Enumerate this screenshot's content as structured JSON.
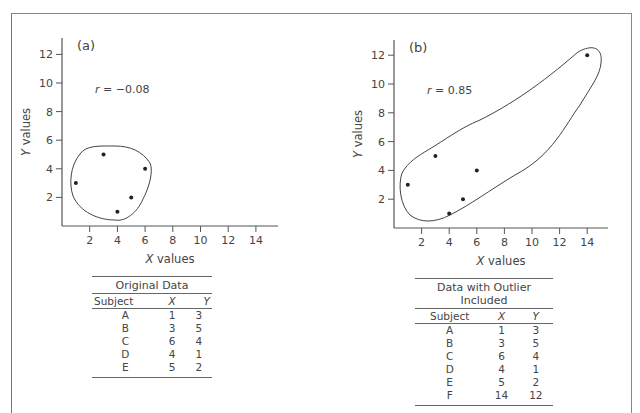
{
  "chart_data": [
    {
      "type": "scatter",
      "panel_label": "(a)",
      "annotation": "r = -0.08",
      "r_symbol": "r",
      "r_value": "= −0.08",
      "xlabel": "X values",
      "ylabel": "Y values",
      "xticks": [
        2,
        4,
        6,
        8,
        10,
        12,
        14
      ],
      "yticks": [
        2,
        4,
        6,
        8,
        10,
        12
      ],
      "xlim": [
        0,
        15
      ],
      "ylim": [
        0,
        13
      ],
      "grid": false,
      "points": [
        {
          "subject": "A",
          "x": 1,
          "y": 3
        },
        {
          "subject": "B",
          "x": 3,
          "y": 5
        },
        {
          "subject": "C",
          "x": 6,
          "y": 4
        },
        {
          "subject": "D",
          "x": 4,
          "y": 1
        },
        {
          "subject": "E",
          "x": 5,
          "y": 2
        }
      ],
      "table": {
        "title": "Original Data",
        "columns": [
          "Subject",
          "X",
          "Y"
        ],
        "rows": [
          [
            "A",
            "1",
            "3"
          ],
          [
            "B",
            "3",
            "5"
          ],
          [
            "C",
            "6",
            "4"
          ],
          [
            "D",
            "4",
            "1"
          ],
          [
            "E",
            "5",
            "2"
          ]
        ]
      }
    },
    {
      "type": "scatter",
      "panel_label": "(b)",
      "annotation": "r = 0.85",
      "r_symbol": "r",
      "r_value": "= 0.85",
      "xlabel": "X values",
      "ylabel": "Y values",
      "xticks": [
        2,
        4,
        6,
        8,
        10,
        12,
        14
      ],
      "yticks": [
        2,
        4,
        6,
        8,
        10,
        12
      ],
      "xlim": [
        0,
        15
      ],
      "ylim": [
        0,
        13
      ],
      "grid": false,
      "points": [
        {
          "subject": "A",
          "x": 1,
          "y": 3
        },
        {
          "subject": "B",
          "x": 3,
          "y": 5
        },
        {
          "subject": "C",
          "x": 6,
          "y": 4
        },
        {
          "subject": "D",
          "x": 4,
          "y": 1
        },
        {
          "subject": "E",
          "x": 5,
          "y": 2
        },
        {
          "subject": "F",
          "x": 14,
          "y": 12
        }
      ],
      "table": {
        "title": "Data with Outlier Included",
        "columns": [
          "Subject",
          "X",
          "Y"
        ],
        "rows": [
          [
            "A",
            "1",
            "3"
          ],
          [
            "B",
            "3",
            "5"
          ],
          [
            "C",
            "6",
            "4"
          ],
          [
            "D",
            "4",
            "1"
          ],
          [
            "E",
            "5",
            "2"
          ],
          [
            "F",
            "14",
            "12"
          ]
        ]
      }
    }
  ],
  "colors": {
    "axis": "#555555",
    "text": "#444444",
    "point": "#222222",
    "frame": "#888888"
  }
}
